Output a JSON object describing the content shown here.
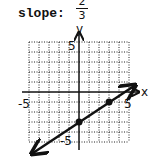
{
  "header": {
    "label": "slope:",
    "slope_numerator": "2",
    "slope_denominator": "3"
  },
  "graph": {
    "x_axis_label": "x",
    "y_axis_label": "y",
    "tick_labels": {
      "x_min": "-5",
      "x_max": "5",
      "y_max": "5",
      "y_min": "-5"
    },
    "range": {
      "x": [
        -5,
        5
      ],
      "y": [
        -5,
        5
      ]
    },
    "grid": "dotted",
    "points": [
      {
        "x": 0,
        "y": -3
      },
      {
        "x": 3,
        "y": -1
      }
    ],
    "line": {
      "slope": "2/3",
      "y_intercept": -3,
      "arrows": "both"
    }
  }
}
